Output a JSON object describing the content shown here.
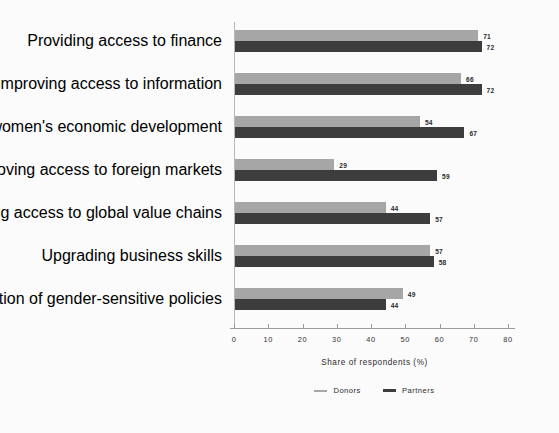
{
  "chart_data": {
    "type": "bar",
    "orientation": "horizontal",
    "title": "",
    "xlabel": "Share of respondents (%)",
    "ylabel": "",
    "xlim": [
      0,
      80
    ],
    "xticks": [
      0,
      10,
      20,
      30,
      40,
      50,
      60,
      70,
      80
    ],
    "grid": false,
    "legend_position": "bottom-center",
    "categories": [
      "Providing access to finance",
      "Improving access to information",
      "Supporting women's economic development",
      "Improving access to foreign markets",
      "Improving access to global value chains",
      "Upgrading business skills",
      "Supporting elaboration of gender-sensitive policies"
    ],
    "series": [
      {
        "name": "Donors",
        "color": "#a6a6a6",
        "values": [
          71,
          66,
          54,
          29,
          44,
          57,
          49
        ]
      },
      {
        "name": "Partners",
        "color": "#3d3d3d",
        "values": [
          72,
          72,
          67,
          59,
          57,
          58,
          44
        ]
      }
    ]
  },
  "legend": {
    "items": [
      {
        "label": "Donors",
        "color": "#a6a6a6"
      },
      {
        "label": "Partners",
        "color": "#3d3d3d"
      }
    ]
  },
  "axis": {
    "x_title": "Share of respondents (%)",
    "x_tick_labels": [
      "0",
      "10",
      "20",
      "30",
      "40",
      "50",
      "60",
      "70",
      "80"
    ]
  },
  "colors": {
    "background": "#fbfbfb",
    "donors": "#a6a6a6",
    "partners": "#3d3d3d",
    "axis": "#9a9a9a",
    "text": "#2a2a2a"
  }
}
